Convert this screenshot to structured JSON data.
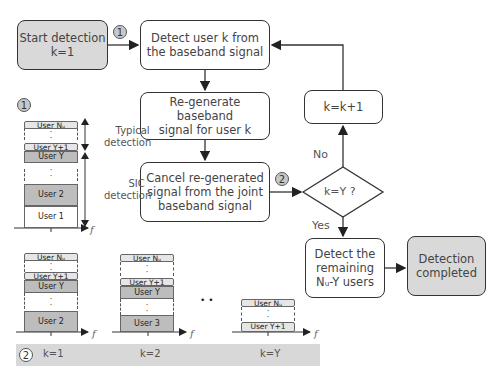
{
  "flowchart": {
    "start": {
      "line1": "Start detection",
      "line2": "k=1"
    },
    "detect_user": {
      "line1": "Detect user k from",
      "line2": "the baseband signal"
    },
    "regenerate": {
      "line1": "Re-generate baseband",
      "line2": "signal for user k"
    },
    "cancel": {
      "line1": "Cancel re-generated",
      "line2": "signal from the joint",
      "line3": "baseband signal"
    },
    "increment": {
      "label": "k=k+1"
    },
    "decision": {
      "label": "k=Y ?",
      "no_label": "No",
      "yes_label": "Yes"
    },
    "detect_remaining": {
      "line1": "Detect the",
      "line2": "remaining",
      "line3": "Nᵤ-Y users"
    },
    "completed": {
      "line1": "Detection",
      "line2": "completed"
    },
    "marker1": "1",
    "marker2": "2"
  },
  "spectrum_main": {
    "marker": "1",
    "bars": {
      "user_nu": "User Nᵤ",
      "user_y1": "User Y+1",
      "user_y": "User Y",
      "user_2": "User 2",
      "user_1": "User 1"
    },
    "typical_label_1": "Typical",
    "typical_label_2": "detection",
    "sic_label_1": "SIC",
    "sic_label_2": "detection",
    "axis_label": "f"
  },
  "spectrum_steps": {
    "marker": "2",
    "steps": [
      {
        "k_label": "k=1",
        "bars": [
          "User Nᵤ",
          "User Y+1",
          "User Y",
          "User 2"
        ]
      },
      {
        "k_label": "k=2",
        "bars": [
          "User Nᵤ",
          "User Y+1",
          "User Y",
          "User 3"
        ]
      },
      {
        "k_label": "k=Y",
        "bars": [
          "User Nᵤ",
          "User Y+1"
        ]
      }
    ],
    "ellipsis": "•  •",
    "axis_label": "f"
  },
  "colors": {
    "gray_box": "#d9d9d9",
    "mid_bar": "#bdbdbd",
    "light_bar": "#e6e6e6",
    "band": "#d8d8d8",
    "stroke": "#333333"
  }
}
